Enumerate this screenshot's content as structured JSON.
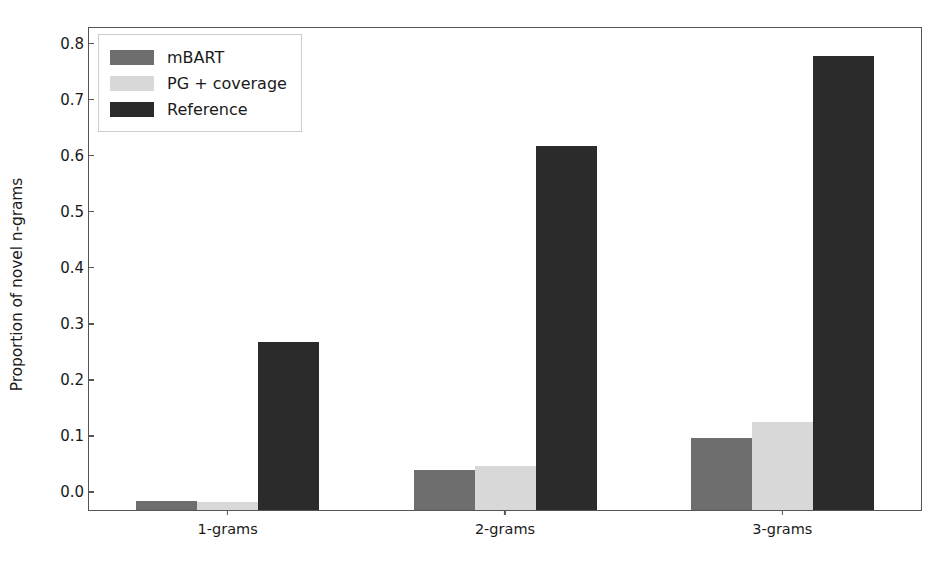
{
  "chart_data": {
    "type": "bar",
    "title": "",
    "xlabel": "",
    "ylabel": "Proportion of novel n-grams",
    "categories": [
      "1-grams",
      "2-grams",
      "3-grams"
    ],
    "series": [
      {
        "name": "mBART",
        "color": "#6e6e6e",
        "values": [
          0.016,
          0.072,
          0.128
        ]
      },
      {
        "name": "PG + coverage",
        "color": "#d8d8d8",
        "values": [
          0.015,
          0.078,
          0.157
        ]
      },
      {
        "name": "Reference",
        "color": "#2b2b2b",
        "values": [
          0.3,
          0.65,
          0.81
        ]
      }
    ],
    "ylim": [
      0.0,
      0.86
    ],
    "yticks": [
      0.0,
      0.1,
      0.2,
      0.3,
      0.4,
      0.5,
      0.6,
      0.7,
      0.8
    ],
    "ytick_labels": [
      "0.0",
      "0.1",
      "0.2",
      "0.3",
      "0.4",
      "0.5",
      "0.6",
      "0.7",
      "0.8"
    ],
    "grid": false,
    "legend_position": "upper left",
    "bar_style": "grouped-adjacent"
  },
  "legend": {
    "entries": [
      {
        "label": "mBART",
        "swatch": "#6e6e6e"
      },
      {
        "label": "PG + coverage",
        "swatch": "#d8d8d8"
      },
      {
        "label": "Reference",
        "swatch": "#2b2b2b"
      }
    ]
  },
  "axes": {
    "ylabel": "Proportion of novel n-grams",
    "ytick_labels": [
      "0.0",
      "0.1",
      "0.2",
      "0.3",
      "0.4",
      "0.5",
      "0.6",
      "0.7",
      "0.8"
    ],
    "xtick_labels": [
      "1-grams",
      "2-grams",
      "3-grams"
    ]
  }
}
